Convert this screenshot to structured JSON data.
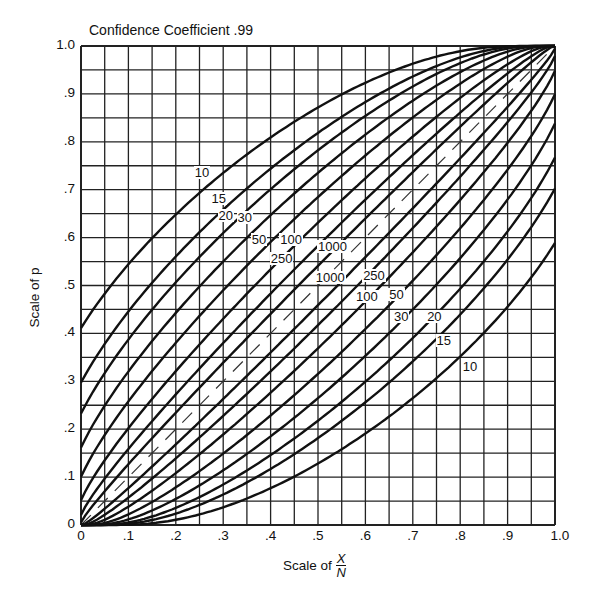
{
  "chart_data": {
    "type": "line",
    "title": "Confidence Coefficient .99",
    "xlabel": "Scale of X/N",
    "xlabel_main": "Scale of",
    "xlabel_num": "X",
    "xlabel_den": "N",
    "ylabel": "Scale of p",
    "xlim": [
      0,
      1.0
    ],
    "ylim": [
      0,
      1.0
    ],
    "grid": true,
    "grid_step": 0.05,
    "confidence": 0.99,
    "x_ticks": [
      "0",
      ".1",
      ".2",
      ".3",
      ".4",
      ".5",
      ".6",
      ".7",
      ".8",
      ".9",
      "1.0"
    ],
    "y_ticks": [
      "0",
      ".1",
      ".2",
      ".3",
      ".4",
      ".5",
      ".6",
      ".7",
      ".8",
      ".9",
      "1.0"
    ],
    "sample_sizes": [
      10,
      15,
      20,
      30,
      50,
      100,
      250,
      1000
    ],
    "series": [
      {
        "name": "10 (upper)",
        "n": 10,
        "bound": "upper",
        "points": [
          [
            0,
            0.41
          ],
          [
            0.1,
            0.54
          ],
          [
            0.2,
            0.62
          ],
          [
            0.3,
            0.7
          ],
          [
            0.4,
            0.77
          ],
          [
            0.5,
            0.84
          ],
          [
            0.6,
            0.89
          ],
          [
            0.7,
            0.94
          ],
          [
            0.8,
            0.97
          ],
          [
            0.9,
            0.995
          ],
          [
            1.0,
            1.0
          ]
        ]
      },
      {
        "name": "10 (lower)",
        "n": 10,
        "bound": "lower",
        "points": [
          [
            0,
            0
          ],
          [
            0.1,
            0.005
          ],
          [
            0.2,
            0.03
          ],
          [
            0.3,
            0.06
          ],
          [
            0.4,
            0.11
          ],
          [
            0.5,
            0.16
          ],
          [
            0.6,
            0.23
          ],
          [
            0.7,
            0.3
          ],
          [
            0.8,
            0.38
          ],
          [
            0.9,
            0.46
          ],
          [
            1.0,
            0.59
          ]
        ]
      },
      {
        "name": "15",
        "n": 15
      },
      {
        "name": "20",
        "n": 20
      },
      {
        "name": "30",
        "n": 30
      },
      {
        "name": "50",
        "n": 50
      },
      {
        "name": "100",
        "n": 100
      },
      {
        "name": "250",
        "n": 250
      },
      {
        "name": "1000",
        "n": 1000
      }
    ],
    "diagonal": "dashed line p = X/N",
    "curve_labels_upper": [
      {
        "text": "10",
        "x": 0.255,
        "y": 0.735
      },
      {
        "text": "15",
        "x": 0.29,
        "y": 0.68
      },
      {
        "text": "20",
        "x": 0.305,
        "y": 0.645
      },
      {
        "text": "30",
        "x": 0.345,
        "y": 0.64
      },
      {
        "text": "50",
        "x": 0.375,
        "y": 0.595
      },
      {
        "text": "100",
        "x": 0.435,
        "y": 0.595
      },
      {
        "text": "250",
        "x": 0.415,
        "y": 0.555
      },
      {
        "text": "1000",
        "x": 0.515,
        "y": 0.58
      }
    ],
    "curve_labels_lower": [
      {
        "text": "1000",
        "x": 0.51,
        "y": 0.515
      },
      {
        "text": "250",
        "x": 0.61,
        "y": 0.52
      },
      {
        "text": "100",
        "x": 0.595,
        "y": 0.475
      },
      {
        "text": "50",
        "x": 0.665,
        "y": 0.48
      },
      {
        "text": "30",
        "x": 0.675,
        "y": 0.435
      },
      {
        "text": "20",
        "x": 0.745,
        "y": 0.435
      },
      {
        "text": "15",
        "x": 0.765,
        "y": 0.385
      },
      {
        "text": "10",
        "x": 0.82,
        "y": 0.33
      }
    ]
  }
}
